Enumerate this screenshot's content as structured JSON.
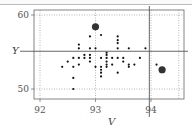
{
  "chart_data": {
    "type": "scatter",
    "title": "",
    "xlabel": "V",
    "ylabel": "Y",
    "xlim": [
      91.89,
      94.6
    ],
    "ylim": [
      47.8,
      60.7
    ],
    "xticks": [
      92,
      93,
      94
    ],
    "yticks": [
      50,
      60
    ],
    "xtick_labels": [
      "92",
      "93",
      "94"
    ],
    "ytick_labels": [
      "50",
      "60"
    ],
    "grid": true,
    "grid_style": "dotted",
    "extra_gridlines_x": [
      94.5
    ],
    "reference_lines": {
      "horizontal_y": 55.1,
      "vertical_x": 93.97
    },
    "legend": null,
    "series": [
      {
        "name": "observations",
        "marker": "small-dot",
        "color": "#111111",
        "points": [
          [
            92.4,
            53.0
          ],
          [
            92.5,
            53.7
          ],
          [
            92.6,
            54.2
          ],
          [
            92.6,
            53.0
          ],
          [
            92.6,
            51.5
          ],
          [
            92.6,
            50.0
          ],
          [
            92.7,
            56.0
          ],
          [
            92.7,
            55.5
          ],
          [
            92.7,
            54.2
          ],
          [
            92.7,
            53.3
          ],
          [
            92.8,
            54.6
          ],
          [
            92.8,
            54.2
          ],
          [
            92.9,
            57.1
          ],
          [
            92.9,
            55.5
          ],
          [
            92.9,
            54.6
          ],
          [
            92.9,
            54.2
          ],
          [
            92.9,
            53.7
          ],
          [
            93.0,
            55.5
          ],
          [
            93.0,
            53.0
          ],
          [
            93.1,
            57.3
          ],
          [
            93.1,
            54.2
          ],
          [
            93.1,
            53.0
          ],
          [
            93.1,
            52.6
          ],
          [
            93.1,
            52.2
          ],
          [
            93.1,
            51.7
          ],
          [
            93.2,
            54.9
          ],
          [
            93.2,
            54.6
          ],
          [
            93.2,
            54.2
          ],
          [
            93.2,
            53.7
          ],
          [
            93.2,
            53.3
          ],
          [
            93.2,
            53.0
          ],
          [
            93.3,
            54.2
          ],
          [
            93.3,
            53.3
          ],
          [
            93.4,
            57.1
          ],
          [
            93.4,
            56.6
          ],
          [
            93.4,
            56.2
          ],
          [
            93.4,
            55.5
          ],
          [
            93.4,
            54.2
          ],
          [
            93.4,
            52.2
          ],
          [
            93.5,
            54.2
          ],
          [
            93.5,
            53.7
          ],
          [
            93.6,
            55.5
          ],
          [
            93.6,
            53.3
          ],
          [
            93.6,
            53.0
          ],
          [
            93.7,
            53.3
          ],
          [
            93.8,
            54.2
          ],
          [
            93.9,
            55.5
          ],
          [
            94.1,
            53.3
          ]
        ]
      },
      {
        "name": "highlighted",
        "marker": "large-dot",
        "color": "#333333",
        "points": [
          [
            93.0,
            58.4
          ],
          [
            94.2,
            52.6
          ]
        ]
      }
    ]
  },
  "labels": {
    "x_axis": "V",
    "y_axis": "Y"
  }
}
